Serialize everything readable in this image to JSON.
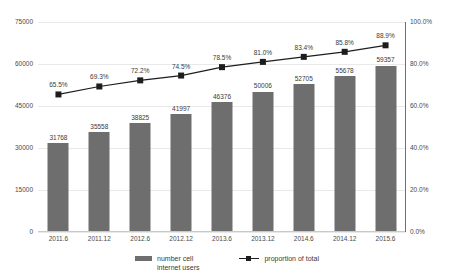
{
  "chart_data": {
    "type": "bar",
    "title": "",
    "subtitle": "",
    "xlabel": "",
    "ylabel": "",
    "categories": [
      "2011.6",
      "2011.12",
      "2012.6",
      "2012.12",
      "2013.6",
      "2013.12",
      "2014.6",
      "2014.12",
      "2015.6"
    ],
    "series": [
      {
        "name": "number cell\ninternet users",
        "type": "bar",
        "axis": "left",
        "color": "#6e6e6e",
        "values": [
          31768,
          35558,
          38825,
          41997,
          46376,
          50006,
          52705,
          55678,
          59357
        ],
        "labels": [
          "31768",
          "35558",
          "38825",
          "41997",
          "46376",
          "50006",
          "52705",
          "55678",
          "59357"
        ]
      },
      {
        "name": "proportion of total",
        "type": "line",
        "axis": "right",
        "color": "#1d1d1d",
        "marker": "square",
        "values": [
          65.5,
          69.3,
          72.2,
          74.5,
          78.5,
          81.0,
          83.4,
          85.8,
          88.9
        ],
        "labels": [
          "65.5%",
          "69.3%",
          "72.2%",
          "74.5%",
          "78.5%",
          "81.0%",
          "83.4%",
          "85.8%",
          "88.9%"
        ]
      }
    ],
    "y_left": {
      "ticks": [
        0,
        15000,
        30000,
        45000,
        60000,
        75000
      ],
      "tick_labels": [
        "0",
        "15000",
        "30000",
        "45000",
        "60000",
        "75000"
      ],
      "ylim": [
        0,
        75000
      ]
    },
    "y_right": {
      "ticks": [
        0,
        20,
        40,
        60,
        80,
        100
      ],
      "tick_labels": [
        "0.0%",
        "20.0%",
        "40.0%",
        "60.0%",
        "80.0%",
        "100.0%"
      ],
      "ylim": [
        0,
        100
      ]
    },
    "grid": true,
    "legend_position": "bottom",
    "legend": [
      {
        "label": "number cell\ninternet users",
        "marker": "bar",
        "color": "#6e6e6e"
      },
      {
        "label": "proportion of total",
        "marker": "line-square",
        "color": "#1d1d1d"
      }
    ]
  }
}
